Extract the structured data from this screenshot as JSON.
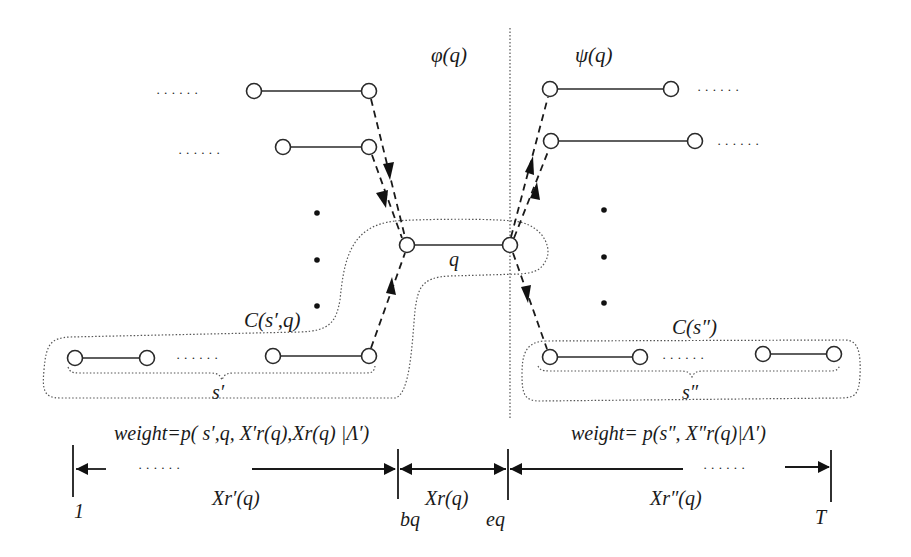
{
  "labels": {
    "phi": "φ(q)",
    "psi": "ψ(q)",
    "q": "q",
    "c_sprime_q": "C(s′,q)",
    "c_sdoubleprime": "C(s″)",
    "s_prime": "s′",
    "s_doubleprime": "s″",
    "weight_left": "weight=p( s′,q, X′r(q),Xr(q) |Λ′)",
    "weight_right": "weight= p(s″, X″r(q)|Λ′)",
    "xr_prime": "Xr′(q)",
    "xr": "Xr(q)",
    "xr_doubleprime": "Xr″(q)",
    "tick_1": "1",
    "tick_bq": "bq",
    "tick_eq": "eq",
    "tick_T": "T",
    "ellipsis": "· · · · · ·"
  },
  "colors": {
    "ink": "#1a1a1a",
    "background": "#ffffff",
    "region_outline": "#555555"
  }
}
